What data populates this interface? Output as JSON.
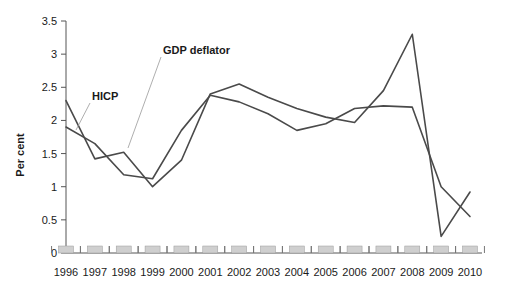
{
  "chart_data": {
    "type": "line",
    "title": "",
    "xlabel": "",
    "ylabel": "Per cent",
    "ylim": [
      0,
      3.5
    ],
    "ytick_values": [
      0,
      0.5,
      1,
      1.5,
      2,
      2.5,
      3,
      3.5
    ],
    "ytick_labels": [
      "0",
      "0.5",
      "1",
      "1.5",
      "2",
      "2.5",
      "3",
      "3.5"
    ],
    "grid": false,
    "legend_position": "inline-annotations",
    "categories": [
      1996,
      1997,
      1998,
      1999,
      2000,
      2001,
      2002,
      2003,
      2004,
      2005,
      2006,
      2007,
      2008,
      2009,
      2010
    ],
    "xtick_labels": [
      "1996",
      "1997",
      "1998",
      "1999",
      "2000",
      "2001",
      "2002",
      "2003",
      "2004",
      "2005",
      "2006",
      "2007",
      "2008",
      "2009",
      "2010"
    ],
    "series": [
      {
        "name": "GDP deflator",
        "values": [
          2.3,
          1.42,
          1.52,
          1.0,
          1.4,
          2.4,
          2.55,
          2.35,
          2.18,
          2.05,
          1.97,
          2.45,
          3.3,
          0.25,
          0.92
        ]
      },
      {
        "name": "HICP",
        "values": [
          1.9,
          1.65,
          1.18,
          1.12,
          1.85,
          2.38,
          2.28,
          2.1,
          1.85,
          1.95,
          2.18,
          2.22,
          2.2,
          1.0,
          0.55
        ]
      }
    ],
    "annotations": [
      {
        "text": "HICP",
        "at_x": 1997.0,
        "at_y": 2.0
      },
      {
        "text": "GDP deflator",
        "at_x": 1999.3,
        "at_y": 2.95
      }
    ],
    "colors": {
      "series_line": "#4a4a4a",
      "axis": "#555555",
      "text": "#1a1a1a",
      "year_block": "#cfcfcf",
      "background": "#ffffff"
    }
  }
}
